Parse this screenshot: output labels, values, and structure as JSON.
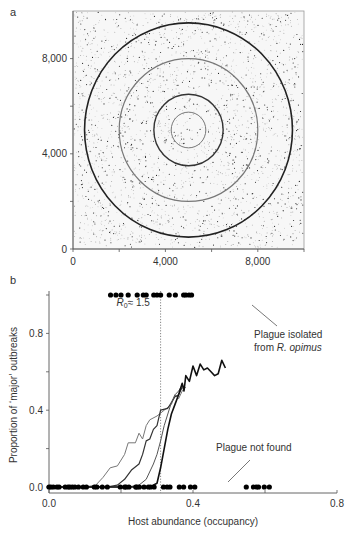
{
  "chart_data": [
    {
      "panel": "a",
      "type": "scatter",
      "title": "",
      "xlabel": "",
      "ylabel": "",
      "xlim": [
        0,
        10000
      ],
      "ylim": [
        0,
        10000
      ],
      "xticks": [
        {
          "v": 0,
          "label": "0"
        },
        {
          "v": 2000,
          "label": ""
        },
        {
          "v": 4000,
          "label": "4,000"
        },
        {
          "v": 6000,
          "label": ""
        },
        {
          "v": 8000,
          "label": "8,000"
        },
        {
          "v": 10000,
          "label": ""
        }
      ],
      "yticks": [
        {
          "v": 0,
          "label": "0"
        },
        {
          "v": 2000,
          "label": ""
        },
        {
          "v": 4000,
          "label": "4,000"
        },
        {
          "v": 6000,
          "label": ""
        },
        {
          "v": 8000,
          "label": "8,000"
        }
      ],
      "description": "Dense random stipple of host burrow points with concentric circles centered at (5000,5000)",
      "circles": [
        {
          "cx": 5000,
          "cy": 5000,
          "r": 4500,
          "color": "#222222",
          "width": 1.6
        },
        {
          "cx": 5000,
          "cy": 5000,
          "r": 3000,
          "color": "#777777",
          "width": 1.2
        },
        {
          "cx": 5000,
          "cy": 5000,
          "r": 1500,
          "color": "#333333",
          "width": 1.4
        },
        {
          "cx": 5000,
          "cy": 5000,
          "r": 750,
          "color": "#777777",
          "width": 1.0
        }
      ]
    },
    {
      "panel": "b",
      "type": "line",
      "title": "",
      "xlabel": "Host abundance (occupancy)",
      "ylabel": "Proportion of ‘major’ outbreaks",
      "xlim": [
        0,
        0.8
      ],
      "ylim": [
        0,
        1.0
      ],
      "xticks": [
        {
          "v": 0.0,
          "label": "0.0"
        },
        {
          "v": 0.2,
          "label": ""
        },
        {
          "v": 0.4,
          "label": "0.4"
        },
        {
          "v": 0.6,
          "label": ""
        },
        {
          "v": 0.8,
          "label": "0.8"
        }
      ],
      "yticks": [
        {
          "v": 0.0,
          "label": "0.0"
        },
        {
          "v": 0.2,
          "label": ""
        },
        {
          "v": 0.4,
          "label": "0.4"
        },
        {
          "v": 0.6,
          "label": ""
        },
        {
          "v": 0.8,
          "label": "0.8"
        },
        {
          "v": 1.0,
          "label": ""
        }
      ],
      "threshold": {
        "x": 0.31,
        "label_main": "R",
        "label_sub": "0",
        "label_rest": "≈ 1.5"
      },
      "series": [
        {
          "name": "curve-1 (lightest, earliest rise)",
          "color": "#777777",
          "width": 1.0,
          "x": [
            0.0,
            0.1,
            0.13,
            0.15,
            0.17,
            0.19,
            0.21,
            0.22,
            0.24,
            0.25,
            0.26,
            0.27,
            0.28,
            0.3,
            0.32,
            0.34,
            0.35,
            0.36,
            0.37,
            0.38
          ],
          "y": [
            0.0,
            0.0,
            0.01,
            0.05,
            0.1,
            0.11,
            0.17,
            0.23,
            0.23,
            0.28,
            0.25,
            0.32,
            0.35,
            0.37,
            0.4,
            0.43,
            0.48,
            0.46,
            0.5,
            0.52
          ]
        },
        {
          "name": "curve-2",
          "color": "#333333",
          "width": 1.2,
          "x": [
            0.0,
            0.16,
            0.19,
            0.21,
            0.23,
            0.25,
            0.26,
            0.27,
            0.28,
            0.29,
            0.3,
            0.31,
            0.33,
            0.34,
            0.35,
            0.36,
            0.37
          ],
          "y": [
            0.0,
            0.0,
            0.01,
            0.04,
            0.09,
            0.12,
            0.17,
            0.24,
            0.25,
            0.3,
            0.32,
            0.4,
            0.41,
            0.44,
            0.47,
            0.48,
            0.52
          ]
        },
        {
          "name": "curve-3",
          "color": "#555555",
          "width": 1.0,
          "x": [
            0.0,
            0.22,
            0.25,
            0.27,
            0.29,
            0.3,
            0.31,
            0.32,
            0.33,
            0.34,
            0.35,
            0.36,
            0.37
          ],
          "y": [
            0.0,
            0.0,
            0.01,
            0.04,
            0.12,
            0.17,
            0.24,
            0.32,
            0.38,
            0.44,
            0.48,
            0.5,
            0.53
          ]
        },
        {
          "name": "curve-4 (darkest, steepest, extends to 0.49)",
          "color": "#111111",
          "width": 1.6,
          "x": [
            0.0,
            0.28,
            0.3,
            0.31,
            0.32,
            0.33,
            0.34,
            0.35,
            0.36,
            0.37,
            0.375,
            0.38,
            0.39,
            0.4,
            0.41,
            0.42,
            0.43,
            0.44,
            0.45,
            0.46,
            0.47,
            0.48,
            0.49
          ],
          "y": [
            0.0,
            0.0,
            0.02,
            0.1,
            0.2,
            0.3,
            0.38,
            0.43,
            0.48,
            0.54,
            0.5,
            0.58,
            0.55,
            0.63,
            0.58,
            0.64,
            0.61,
            0.62,
            0.6,
            0.58,
            0.59,
            0.66,
            0.62
          ]
        }
      ],
      "observations": {
        "plague_found_y": 1.0,
        "plague_found_x": [
          0.171,
          0.186,
          0.2,
          0.22,
          0.245,
          0.262,
          0.27,
          0.291,
          0.3,
          0.31,
          0.334,
          0.351,
          0.374,
          0.38,
          0.389,
          0.396
        ],
        "plague_not_found_y": 0.0,
        "plague_not_found_x": [
          0.0,
          0.005,
          0.012,
          0.022,
          0.028,
          0.045,
          0.053,
          0.058,
          0.065,
          0.072,
          0.082,
          0.095,
          0.104,
          0.126,
          0.133,
          0.148,
          0.162,
          0.198,
          0.21,
          0.214,
          0.222,
          0.241,
          0.244,
          0.251,
          0.264,
          0.276,
          0.282,
          0.292,
          0.318,
          0.328,
          0.336,
          0.362,
          0.374,
          0.393,
          0.405,
          0.548,
          0.568,
          0.576,
          0.582,
          0.598,
          0.612
        ]
      },
      "annotations": [
        {
          "text": "Plague isolated",
          "text2_prefix": "from ",
          "text2_italic": "R. opimus"
        },
        {
          "text": "Plague not found"
        }
      ]
    }
  ],
  "panels": {
    "a": {
      "label": "a"
    },
    "b": {
      "label": "b"
    }
  }
}
